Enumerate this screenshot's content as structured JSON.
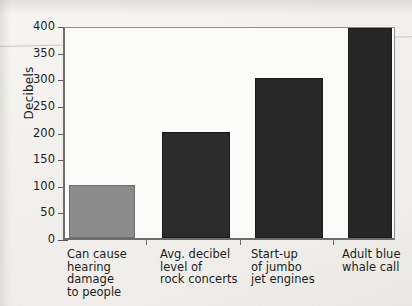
{
  "chart_data": {
    "type": "bar",
    "title": "",
    "xlabel": "",
    "ylabel": "Decibels",
    "ylim": [
      0,
      400
    ],
    "yticks": [
      0,
      50,
      100,
      150,
      200,
      250,
      300,
      350,
      400
    ],
    "grid": false,
    "legend": null,
    "categories": [
      "Can cause hearing damage to people",
      "Avg. decibel level of rock concerts",
      "Start-up of jumbo jet engines",
      "Adult blue whale call"
    ],
    "category_lines": [
      [
        "Can cause",
        "hearing",
        "damage",
        "to people"
      ],
      [
        "Avg. decibel",
        "level of",
        "rock concerts"
      ],
      [
        "Start-up",
        "of jumbo",
        "jet engines"
      ],
      [
        "Adult blue",
        "whale call"
      ]
    ],
    "values": [
      100,
      200,
      300,
      395
    ],
    "bar_colors": [
      "#8c8c8c",
      "#2b2b2b",
      "#272727",
      "#262626"
    ]
  },
  "axis": {
    "y_title": "Decibels",
    "y_tick_labels": [
      "400",
      "350",
      "300",
      "250",
      "200",
      "150",
      "100",
      "50",
      "0"
    ]
  }
}
